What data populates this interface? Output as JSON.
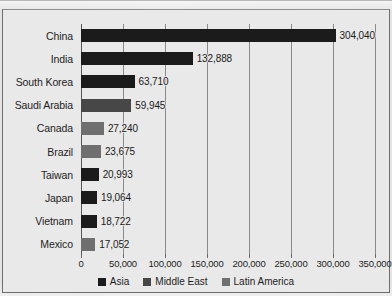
{
  "chart_data": {
    "type": "bar",
    "orientation": "horizontal",
    "title": "",
    "subtitle": "",
    "xlabel": "",
    "ylabel": "",
    "xlim": [
      0,
      350000
    ],
    "xticks": [
      0,
      50000,
      100000,
      150000,
      200000,
      250000,
      300000,
      350000
    ],
    "xtick_labels": [
      "0",
      "50,000",
      "100,000",
      "150,000",
      "200,000",
      "250,000",
      "300,000",
      "350,000"
    ],
    "grid": "vertical",
    "legend_position": "bottom",
    "categories": [
      "China",
      "India",
      "South Korea",
      "Saudi Arabia",
      "Canada",
      "Brazil",
      "Taiwan",
      "Japan",
      "Vietnam",
      "Mexico"
    ],
    "values": [
      304040,
      132888,
      63710,
      59945,
      27240,
      23675,
      20993,
      19064,
      18722,
      17052
    ],
    "value_labels": [
      "304,040",
      "132,888",
      "63,710",
      "59,945",
      "27,240",
      "23,675",
      "20,993",
      "19,064",
      "18,722",
      "17,052"
    ],
    "groups": [
      "Asia",
      "Asia",
      "Asia",
      "Middle East",
      "Latin America",
      "Latin America",
      "Asia",
      "Asia",
      "Asia",
      "Latin America"
    ],
    "bars": [
      {
        "category": "China",
        "value": 304040,
        "label": "304,040",
        "group": "Asia"
      },
      {
        "category": "India",
        "value": 132888,
        "label": "132,888",
        "group": "Asia"
      },
      {
        "category": "South Korea",
        "value": 63710,
        "label": "63,710",
        "group": "Asia"
      },
      {
        "category": "Saudi Arabia",
        "value": 59945,
        "label": "59,945",
        "group": "Middle East"
      },
      {
        "category": "Canada",
        "value": 27240,
        "label": "27,240",
        "group": "Latin America"
      },
      {
        "category": "Brazil",
        "value": 23675,
        "label": "23,675",
        "group": "Latin America"
      },
      {
        "category": "Taiwan",
        "value": 20993,
        "label": "20,993",
        "group": "Asia"
      },
      {
        "category": "Japan",
        "value": 19064,
        "label": "19,064",
        "group": "Asia"
      },
      {
        "category": "Vietnam",
        "value": 18722,
        "label": "18,722",
        "group": "Asia"
      },
      {
        "category": "Mexico",
        "value": 17052,
        "label": "17,052",
        "group": "Latin America"
      }
    ],
    "legend": [
      {
        "label": "Asia",
        "color": "#1b1b1b"
      },
      {
        "label": "Middle East",
        "color": "#474747"
      },
      {
        "label": "Latin America",
        "color": "#6f6f6f"
      }
    ],
    "colors": {
      "Asia": "#1b1b1b",
      "Middle East": "#474747",
      "Latin America": "#6f6f6f",
      "background": "#e9e9e9",
      "gridline": "#8a8a8a",
      "axis": "#555555",
      "text": "#1d1d1d",
      "frame": "#6e6e6e"
    }
  }
}
